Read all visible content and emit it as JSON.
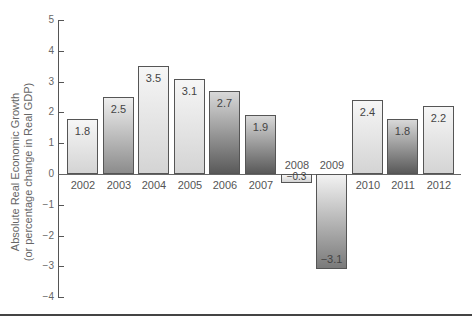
{
  "chart_data": {
    "type": "bar",
    "title": "",
    "xlabel": "",
    "ylabel": "Absolute Real Economic Growth (or percentage change in Real GDP)",
    "ylabel_lines": [
      "Absolute Real Economic Growth",
      "(or percentage change in Real GDP)"
    ],
    "categories": [
      "2002",
      "2003",
      "2004",
      "2005",
      "2006",
      "2007",
      "2008",
      "2009",
      "2010",
      "2011",
      "2012"
    ],
    "values": [
      1.8,
      2.5,
      3.5,
      3.1,
      2.7,
      1.9,
      -0.3,
      -3.1,
      2.4,
      1.8,
      2.2
    ],
    "value_labels": [
      "1.8",
      "2.5",
      "3.5",
      "3.1",
      "2.7",
      "1.9",
      "−0.3",
      "−3.1",
      "2.4",
      "1.8",
      "2.2"
    ],
    "ylim": [
      -4,
      5
    ],
    "yticks": [
      5,
      4,
      3,
      2,
      1,
      0,
      -1,
      -2,
      -3,
      -4
    ],
    "ytick_labels": [
      "5",
      "4",
      "3",
      "2",
      "1",
      "0",
      "−1",
      "−2",
      "−3",
      "−4"
    ],
    "grid": false,
    "legend": null
  }
}
